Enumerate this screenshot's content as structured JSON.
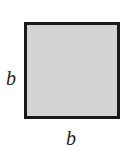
{
  "diagram": {
    "shape": "square",
    "fill_color": "#d3d3d3",
    "border_color": "#1a1a1a",
    "labels": {
      "left_side": "b",
      "bottom_side": "b"
    }
  }
}
